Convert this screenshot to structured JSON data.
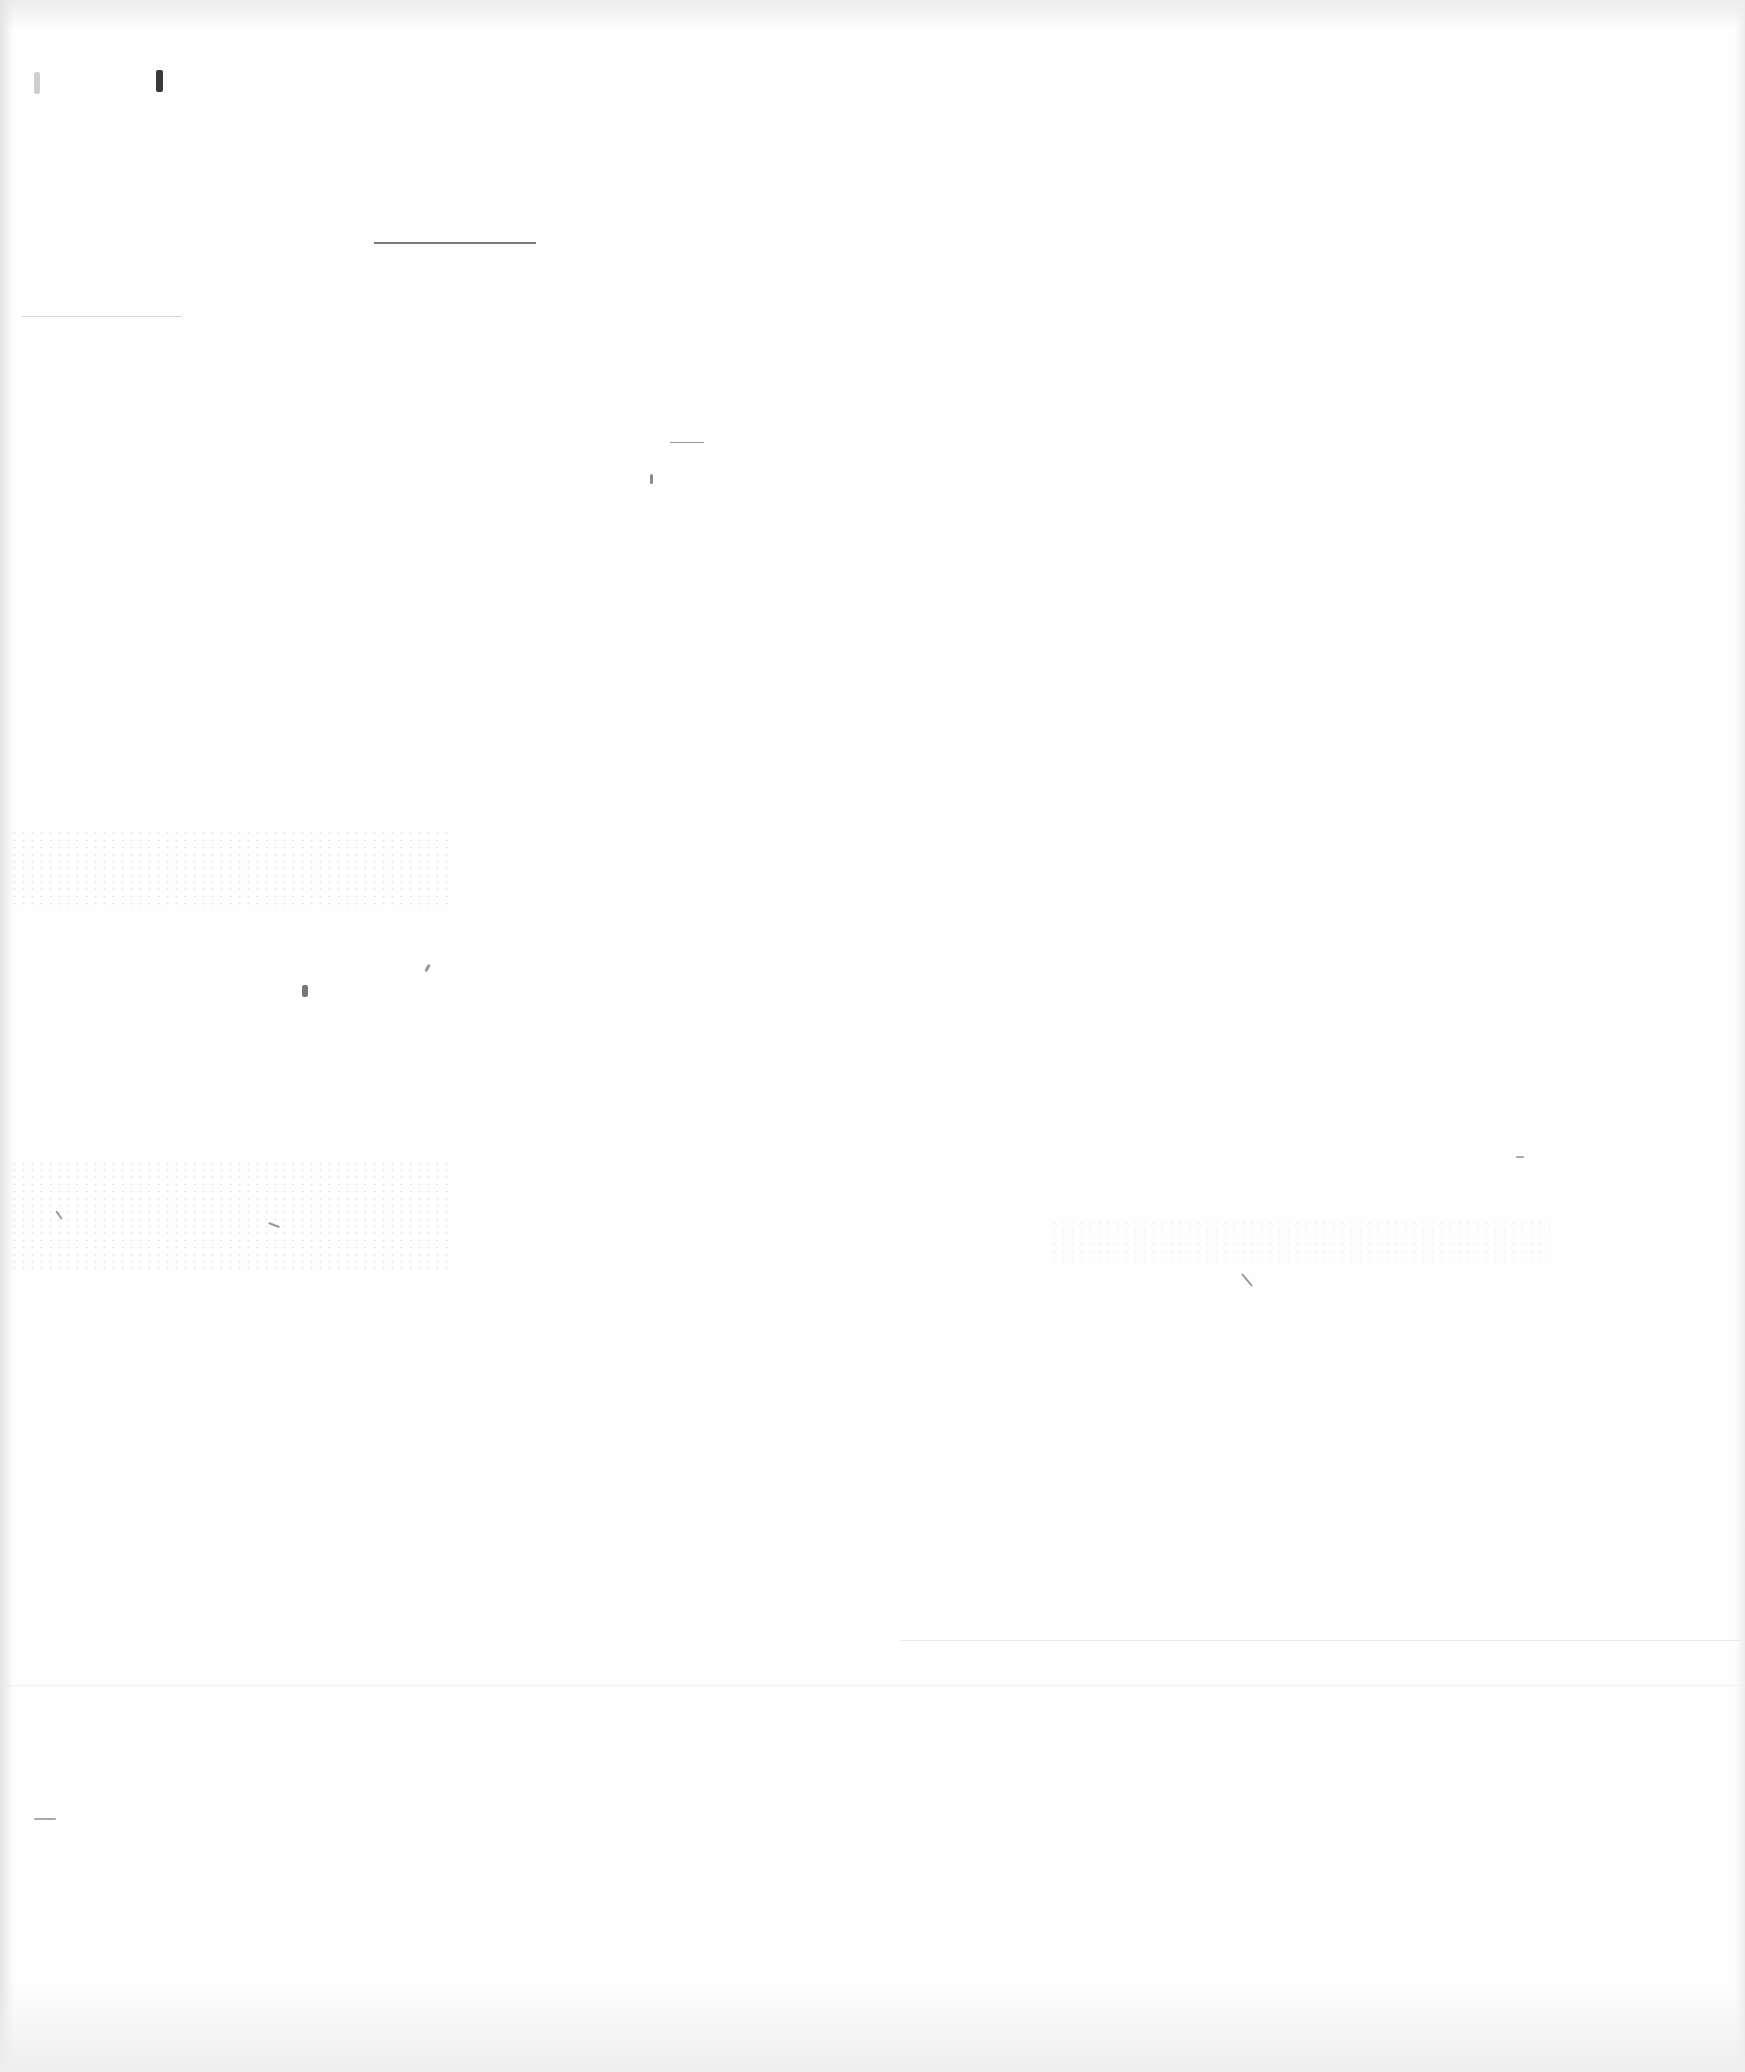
{
  "page": {
    "type": "blank-scanned-page",
    "background": "#fefefe",
    "rules": [
      {
        "id": "top-rule",
        "x": 374,
        "y": 242,
        "width": 162
      },
      {
        "id": "faint-left-rule",
        "x": 22,
        "y": 316,
        "width": 160
      },
      {
        "id": "short-dash",
        "x": 670,
        "y": 442,
        "width": 34
      }
    ],
    "marks_color": "#6e6e6e"
  }
}
